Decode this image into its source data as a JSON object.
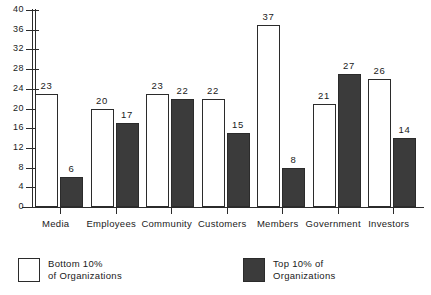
{
  "chart_data": {
    "type": "bar",
    "title": "",
    "subtitle": "",
    "xlabel": "",
    "ylabel": "",
    "ylim": [
      0,
      40
    ],
    "yticks": [
      0,
      4,
      8,
      12,
      16,
      20,
      24,
      28,
      32,
      36,
      40
    ],
    "grid": false,
    "legend_position": "bottom",
    "categories": [
      "Media",
      "Employees",
      "Community",
      "Customers",
      "Members",
      "Government",
      "Investors"
    ],
    "series": [
      {
        "name": "Bottom 10% of Organizations",
        "color": "#ffffff",
        "values": [
          23,
          20,
          23,
          22,
          37,
          21,
          26
        ]
      },
      {
        "name": "Top 10% of Organizations",
        "color": "#3b3b3b",
        "values": [
          6,
          17,
          22,
          15,
          8,
          27,
          14
        ]
      }
    ]
  },
  "legend": {
    "bottom": {
      "line1": "Bottom  10%",
      "line2": "of  Organizations"
    },
    "top": {
      "line1": "Top  10%  of",
      "line2": "Organizations"
    }
  }
}
